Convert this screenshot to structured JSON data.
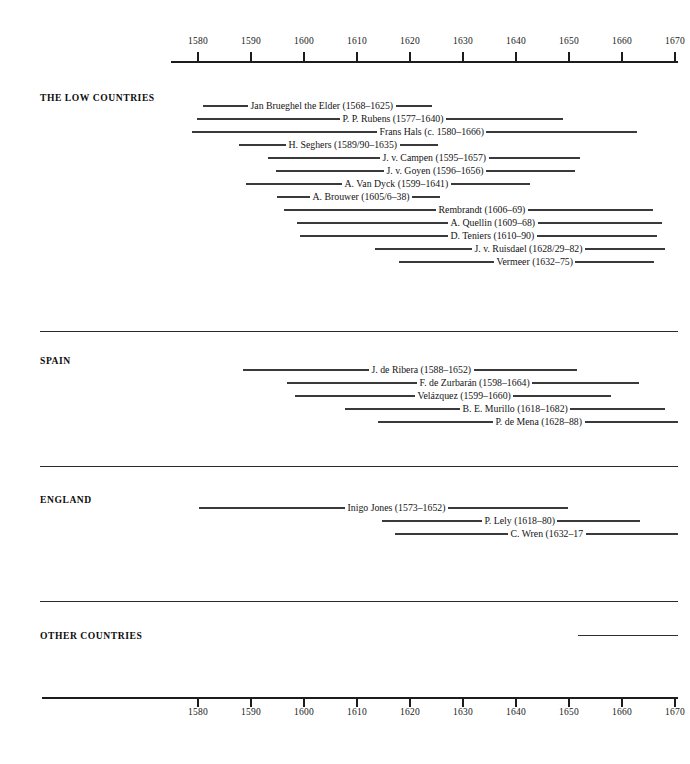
{
  "chart_data": {
    "type": "bar",
    "xlabel": "",
    "ylabel": "",
    "xlim": [
      1568,
      1682
    ],
    "grid": false,
    "legend": false,
    "orientation": "horizontal",
    "axis_tick_labels": [
      "1580",
      "1590",
      "1600",
      "1610",
      "1620",
      "1630",
      "1640",
      "1650",
      "1660",
      "1670"
    ],
    "axis_tick_values": [
      1580,
      1590,
      1600,
      1610,
      1620,
      1630,
      1640,
      1650,
      1660,
      1670
    ],
    "axis_positions": [
      "top",
      "bottom"
    ],
    "categories": [
      "Jan Brueghel the Elder",
      "P. P. Rubens",
      "Frans Hals",
      "H. Seghers",
      "J. v. Campen",
      "J. v. Goyen",
      "A. Van Dyck",
      "A. Brouwer",
      "Rembrandt",
      "A. Quellin",
      "D. Teniers",
      "J. v. Ruisdael",
      "Vermeer",
      "J. de Ribera",
      "F. de Zurbarán",
      "Velázquez",
      "B. E. Murillo",
      "P. de Mena",
      "Inigo Jones",
      "P. Lely",
      "C. Wren"
    ],
    "series": [
      {
        "name": "lifespan",
        "values": [
          [
            1568,
            1625
          ],
          [
            1577,
            1640
          ],
          [
            1580,
            1666
          ],
          [
            1589,
            1635
          ],
          [
            1595,
            1657
          ],
          [
            1596,
            1656
          ],
          [
            1599,
            1641
          ],
          [
            1605,
            1638
          ],
          [
            1606,
            1669
          ],
          [
            1609,
            1668
          ],
          [
            1610,
            1690
          ],
          [
            1628,
            1682
          ],
          [
            1632,
            1675
          ],
          [
            1588,
            1652
          ],
          [
            1598,
            1664
          ],
          [
            1599,
            1660
          ],
          [
            1618,
            1682
          ],
          [
            1628,
            1688
          ],
          [
            1573,
            1652
          ],
          [
            1618,
            1680
          ],
          [
            1632,
            1723
          ]
        ]
      }
    ]
  },
  "sections": [
    {
      "heading": "THE LOW COUNTRIES",
      "rows": [
        {
          "label": "Jan Brueghel the Elder (1568–1625)",
          "left": 203,
          "right": 432,
          "y": 106
        },
        {
          "label": "P. P. Rubens (1577–1640)",
          "left": 197,
          "right": 563,
          "y": 119
        },
        {
          "label": "Frans Hals (c. 1580–1666)",
          "left": 192,
          "right": 637,
          "y": 132
        },
        {
          "label": "H. Seghers (1589/90–1635)",
          "left": 239,
          "right": 438,
          "y": 145
        },
        {
          "label": "J. v. Campen (1595–1657)",
          "left": 268,
          "right": 580,
          "y": 158
        },
        {
          "label": "J. v. Goyen (1596–1656)",
          "left": 276,
          "right": 575,
          "y": 171
        },
        {
          "label": "A. Van Dyck (1599–1641)",
          "left": 246,
          "right": 530,
          "y": 184
        },
        {
          "label": "A. Brouwer (1605/6–38)",
          "left": 277,
          "right": 440,
          "y": 197
        },
        {
          "label": "Rembrandt (1606–69)",
          "left": 284,
          "right": 653,
          "y": 210
        },
        {
          "label": "A. Quellin (1609–68)",
          "left": 297,
          "right": 662,
          "y": 223
        },
        {
          "label": "D. Teniers (1610–90)",
          "left": 300,
          "right": 657,
          "y": 236
        },
        {
          "label": "J. v. Ruisdael (1628/29–82)",
          "left": 375,
          "right": 665,
          "y": 249
        },
        {
          "label": "Vermeer (1632–75)",
          "left": 399,
          "right": 654,
          "y": 262
        }
      ]
    },
    {
      "heading": "SPAIN",
      "rows": [
        {
          "label": "J. de Ribera (1588–1652)",
          "left": 243,
          "right": 577,
          "y": 370
        },
        {
          "label": "F. de Zurbarán (1598–1664)",
          "left": 287,
          "right": 639,
          "y": 383
        },
        {
          "label": "Velázquez (1599–1660)",
          "left": 295,
          "right": 611,
          "y": 396
        },
        {
          "label": "B. E. Murillo (1618–1682)",
          "left": 345,
          "right": 665,
          "y": 409
        },
        {
          "label": "P. de Mena (1628–88)",
          "left": 378,
          "right": 678,
          "y": 422
        }
      ]
    },
    {
      "heading": "ENGLAND",
      "rows": [
        {
          "label": "Inigo Jones (1573–1652)",
          "left": 199,
          "right": 568,
          "y": 508
        },
        {
          "label": "P. Lely (1618–80)",
          "left": 382,
          "right": 640,
          "y": 521
        },
        {
          "label": "C. Wren (1632–17",
          "left": 395,
          "right": 678,
          "y": 534
        }
      ]
    },
    {
      "heading": "OTHER COUNTRIES",
      "rows": []
    }
  ],
  "layout": {
    "heading_positions": [
      {
        "heading": "THE LOW COUNTRIES",
        "x": 40,
        "y": 92
      },
      {
        "heading": "SPAIN",
        "x": 40,
        "y": 355
      },
      {
        "heading": "ENGLAND",
        "x": 40,
        "y": 494
      },
      {
        "heading": "OTHER COUNTRIES",
        "x": 40,
        "y": 630
      }
    ],
    "separators": [
      {
        "y": 331,
        "left": 40,
        "right": 678
      },
      {
        "y": 466,
        "left": 40,
        "right": 678
      },
      {
        "y": 601,
        "left": 40,
        "right": 678
      }
    ],
    "orphan_rule": {
      "y": 635,
      "left": 578,
      "right": 678
    }
  },
  "colors": {
    "ink": "#1a1a1a",
    "rule": "#3a3a3a",
    "axis": "#1c1c1c",
    "paper": "#ffffff"
  }
}
